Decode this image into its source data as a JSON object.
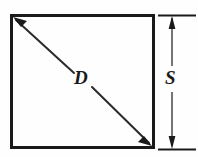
{
  "figure": {
    "type": "engineering-dimension-diagram",
    "background_color": "#fefefe",
    "line_color": "#1a1a1a",
    "shape": {
      "name": "square",
      "stroke_width": 3,
      "left": 11,
      "top": 15,
      "right": 154,
      "bottom": 148
    },
    "labels": {
      "diagonal": "D",
      "side": "S"
    },
    "diagonal_dimension": {
      "label": "D",
      "arrow_start": "top-left-corner",
      "arrow_end": "bottom-right-corner",
      "arrowheads": "both",
      "stroke_width": 2
    },
    "side_dimension": {
      "label": "S",
      "orientation": "vertical",
      "arrowheads": "both",
      "extension_line_top_y": 15,
      "extension_line_bottom_y": 149,
      "dimension_line_x": 172,
      "stroke_width": 1
    }
  }
}
